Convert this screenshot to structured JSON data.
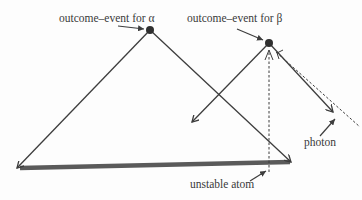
{
  "diagram": {
    "labels": {
      "alpha_event": "outcome–event for α",
      "beta_event": "outcome–event for β",
      "photon": "photon",
      "atom": "unstable atom"
    },
    "colors": {
      "line": "#3d3d3d",
      "bar": "#5a5a5a",
      "dot": "#2f2f2f",
      "background": "#fdfdfd"
    }
  }
}
